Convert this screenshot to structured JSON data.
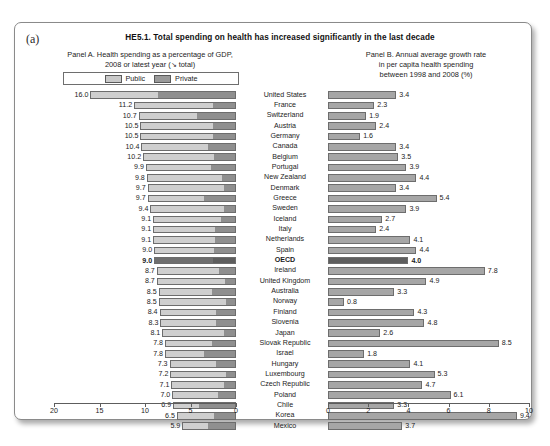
{
  "figure": {
    "panel_letter": "(a)",
    "title": "HE5.1. Total spending on health has increased significantly in the last decade",
    "panelA_heading": "Panel A. Health spending as a percentage of GDP,\n2008 or latest year (↘ total)",
    "panelB_heading": "Panel B. Annual average growth rate\nin per capita health spending\nbetween 1998 and 2008 (%)"
  },
  "legend": {
    "public_label": "Public",
    "private_label": "Private",
    "public_color": "#cfcfcf",
    "private_color": "#8f8f8f",
    "highlight_color": "#5e5e5e"
  },
  "chart_data": {
    "type": "bar",
    "title": "HE5.1. Total spending on health has increased significantly in the last decade",
    "orientation": "horizontal",
    "categories": [
      "United States",
      "France",
      "Switzerland",
      "Austria",
      "Germany",
      "Canada",
      "Belgium",
      "Portugal",
      "New Zealand",
      "Denmark",
      "Greece",
      "Sweden",
      "Iceland",
      "Italy",
      "Netherlands",
      "Spain",
      "OECD",
      "Ireland",
      "United Kingdom",
      "Australia",
      "Norway",
      "Finland",
      "Slovenia",
      "Japan",
      "Slovak Republic",
      "Israel",
      "Hungary",
      "Luxembourg",
      "Czech Republic",
      "Poland",
      "Chile",
      "Korea",
      "Mexico"
    ],
    "highlight_category": "OECD",
    "panelA": {
      "type": "bar",
      "subtype": "stacked",
      "title": "Panel A. Health spending as a percentage of GDP, 2008 or latest year (↘ total)",
      "xlabel": "",
      "ylabel": "",
      "xlim": [
        20,
        0
      ],
      "reversed_axis": true,
      "ticks": [
        "20",
        "15",
        "10",
        "5",
        "0"
      ],
      "tick_values": [
        20,
        15,
        10,
        5,
        0
      ],
      "grid": false,
      "legend_position": "top",
      "series": [
        {
          "name": "Public",
          "values": [
            7.4,
            8.7,
            6.4,
            8.0,
            8.0,
            7.4,
            7.8,
            7.2,
            8.2,
            8.5,
            6.0,
            7.9,
            7.5,
            6.9,
            6.9,
            6.6,
            6.5,
            6.9,
            7.4,
            5.9,
            7.5,
            6.2,
            6.1,
            6.9,
            5.2,
            4.3,
            5.2,
            6.1,
            5.9,
            5.1,
            2.8,
            4.1,
            2.8
          ]
        },
        {
          "name": "Private",
          "values": [
            8.6,
            2.5,
            4.3,
            2.5,
            2.5,
            3.0,
            2.4,
            2.7,
            1.5,
            1.2,
            3.4,
            1.2,
            1.6,
            2.2,
            2.2,
            2.4,
            2.5,
            1.8,
            1.1,
            2.6,
            1.0,
            2.2,
            2.2,
            1.2,
            2.6,
            3.5,
            2.1,
            1.0,
            1.2,
            1.9,
            4.1,
            2.4,
            3.1
          ]
        }
      ],
      "totals": [
        16.0,
        11.2,
        10.7,
        10.5,
        10.5,
        10.4,
        10.2,
        9.9,
        9.8,
        9.7,
        9.7,
        9.4,
        9.1,
        9.1,
        9.1,
        9.0,
        9.0,
        8.7,
        8.7,
        8.5,
        8.5,
        8.4,
        8.3,
        8.1,
        7.8,
        7.8,
        7.3,
        7.2,
        7.1,
        7.0,
        6.9,
        6.5,
        5.9
      ],
      "total_labels": [
        "16.0",
        "11.2",
        "10.7",
        "10.5",
        "10.5",
        "10.4",
        "10.2",
        "9.9",
        "9.8",
        "9.7",
        "9.7",
        "9.4",
        "9.1",
        "9.1",
        "9.1",
        "9.0",
        "9.0",
        "8.7",
        "8.7",
        "8.5",
        "8.5",
        "8.4",
        "8.3",
        "8.1",
        "7.8",
        "7.8",
        "7.3",
        "7.2",
        "7.1",
        "7.0",
        "6.9",
        "6.5",
        "5.9"
      ]
    },
    "panelB": {
      "type": "bar",
      "title": "Panel B. Annual average growth rate in per capita health spending between 1998 and 2008 (%)",
      "xlabel": "",
      "ylabel": "",
      "xlim": [
        0,
        10
      ],
      "ticks": [
        "0",
        "2",
        "4",
        "6",
        "8",
        "10"
      ],
      "tick_values": [
        0,
        2,
        4,
        6,
        8,
        10
      ],
      "grid": false,
      "values": [
        3.4,
        2.3,
        1.9,
        2.4,
        1.6,
        3.4,
        3.5,
        3.9,
        4.4,
        3.4,
        5.4,
        3.9,
        2.7,
        2.4,
        4.1,
        4.4,
        4.0,
        7.8,
        4.9,
        3.3,
        0.8,
        4.3,
        4.8,
        2.6,
        8.5,
        1.8,
        4.1,
        5.3,
        4.7,
        6.1,
        3.3,
        9.4,
        3.7
      ],
      "value_labels": [
        "3.4",
        "2.3",
        "1.9",
        "2.4",
        "1.6",
        "3.4",
        "3.5",
        "3.9",
        "4.4",
        "3.4",
        "5.4",
        "3.9",
        "2.7",
        "2.4",
        "4.1",
        "4.4",
        "4.0",
        "7.8",
        "4.9",
        "3.3",
        "0.8",
        "4.3",
        "4.8",
        "2.6",
        "8.5",
        "1.8",
        "4.1",
        "5.3",
        "4.7",
        "6.1",
        "3.3",
        "9.4",
        "3.7"
      ]
    }
  }
}
